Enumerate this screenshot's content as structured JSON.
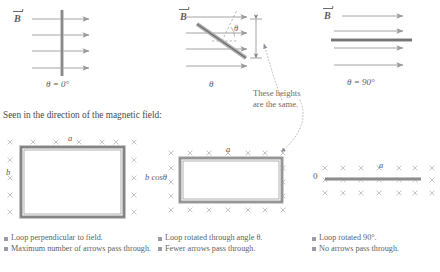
{
  "figure": {
    "section_heading": "Seen in the direction of the magnetic field:",
    "annotation": {
      "line1": "These heights",
      "line2": "are the same."
    }
  },
  "top_panels": [
    {
      "id": "panel-theta-0",
      "field_label": "B",
      "angle_label": "θ = 0°",
      "loop_orientation": "perpendicular",
      "arrow_count": 4
    },
    {
      "id": "panel-theta-general",
      "field_label": "B",
      "angle_label": "θ",
      "angle_marker": "θ",
      "loop_orientation": "tilted",
      "arrow_count": 4
    },
    {
      "id": "panel-theta-90",
      "field_label": "B",
      "angle_label": "θ = 90°",
      "loop_orientation": "edge-on",
      "arrow_count": 4
    }
  ],
  "bottom_panels": [
    {
      "id": "loop-view-perpendicular",
      "width_label": "a",
      "height_label": "b",
      "cross_cols": 7,
      "cross_rows": 5
    },
    {
      "id": "loop-view-rotated",
      "width_label": "a",
      "height_label": "b cosθ",
      "cross_cols": 7,
      "cross_rows": 5
    },
    {
      "id": "loop-view-edge-on",
      "width_label": "a",
      "height_label": "0",
      "cross_cols": 7,
      "cross_rows": 3
    }
  ],
  "captions": [
    {
      "id": "caption-perpendicular",
      "items": [
        "Loop perpendicular to field.",
        "Maximum number of arrows pass through."
      ]
    },
    {
      "id": "caption-rotated",
      "items": [
        "Loop rotated through angle θ.",
        "Fewer arrows pass through."
      ]
    },
    {
      "id": "caption-edge-on",
      "items": [
        "Loop rotated 90°.",
        "No arrows pass through."
      ]
    }
  ],
  "colors": {
    "field_line": "#8a8a8a",
    "loop_dark": "#6e6e6e",
    "loop_light": "#b5b5b5",
    "cross": "#b9b9c4",
    "text": "#5c5c5c",
    "bullet": "#9a9aa8",
    "dotted": "#a9a9b4"
  }
}
